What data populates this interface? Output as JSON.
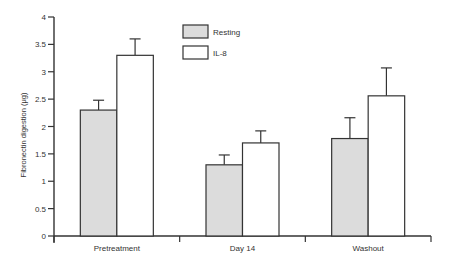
{
  "chart_data": {
    "type": "bar",
    "title": "",
    "xlabel": "",
    "ylabel": "Fibronectin digestion (μg)",
    "ylim": [
      0,
      4
    ],
    "yticks": [
      0,
      0.5,
      1,
      1.5,
      2,
      2.5,
      3,
      3.5,
      4
    ],
    "ytick_labels": [
      "0",
      "0.5",
      "1",
      "1.5",
      "2",
      "2.5",
      "3",
      "3.5",
      "4"
    ],
    "grid": false,
    "legend_position": "top-center",
    "categories": [
      "Pretreatment",
      "Day 14",
      "Washout"
    ],
    "series": [
      {
        "name": "Resting",
        "color": "#dcdcdc",
        "values": [
          2.3,
          1.3,
          1.78
        ],
        "error": [
          0.18,
          0.18,
          0.38
        ]
      },
      {
        "name": "IL-8",
        "color": "#ffffff",
        "values": [
          3.3,
          1.7,
          2.56
        ],
        "error": [
          0.3,
          0.22,
          0.51
        ]
      }
    ]
  }
}
